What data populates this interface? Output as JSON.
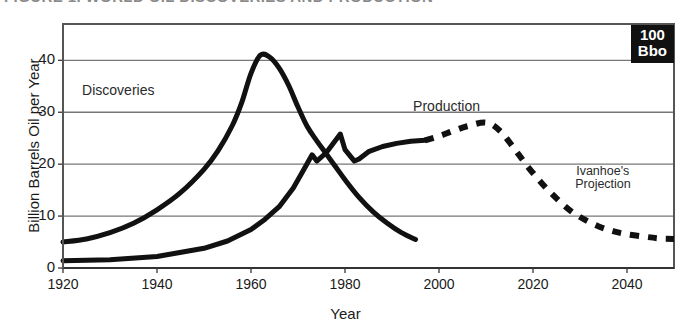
{
  "figure": {
    "caption": "FIGURE 1. WORLD OIL DISCOVERIES AND PRODUCTION",
    "badge_line1": "100",
    "badge_line2": "Bbo",
    "badge_bg": "#111111",
    "badge_fg": "#ffffff",
    "ink_color": "#111111",
    "grid_color": "#777777",
    "frame_color": "#555555"
  },
  "chart_data": {
    "type": "line",
    "title": "",
    "xlabel": "Year",
    "ylabel": "Billion Barrels Oil per Year",
    "xlim": [
      1920,
      2050
    ],
    "ylim": [
      0,
      47
    ],
    "xticks": [
      1920,
      1940,
      1960,
      1980,
      2000,
      2020,
      2040
    ],
    "yticks": [
      0,
      10,
      20,
      30,
      40
    ],
    "xtick_labels": [
      "1920",
      "1940",
      "1960",
      "1980",
      "2000",
      "2020",
      "2040"
    ],
    "ytick_labels": [
      "0",
      "10",
      "20",
      "30",
      "40"
    ],
    "grid": true,
    "grid_axis": "y",
    "legend": "inline-annotations",
    "annotations": [
      {
        "text": "Discoveries",
        "x": 1933,
        "y": 34
      },
      {
        "text": "Production",
        "x": 2003,
        "y": 31
      },
      {
        "text": "Ivanhoe's",
        "x": 2036,
        "y": 18.5
      },
      {
        "text": "Projection",
        "x": 2036,
        "y": 16.0
      }
    ],
    "series": [
      {
        "name": "Discoveries",
        "style": "solid",
        "linewidth": 5,
        "x": [
          1920,
          1925,
          1930,
          1935,
          1940,
          1945,
          1950,
          1953,
          1956,
          1958,
          1960,
          1962,
          1964,
          1966,
          1968,
          1970,
          1972,
          1974,
          1976,
          1978,
          1980,
          1983,
          1986,
          1989,
          1992,
          1995
        ],
        "values": [
          5.0,
          5.6,
          6.8,
          8.6,
          11.2,
          14.5,
          19.0,
          22.6,
          27.4,
          31.8,
          37.5,
          41.0,
          40.6,
          38.5,
          35.2,
          31.0,
          27.2,
          24.5,
          22.0,
          19.5,
          17.0,
          13.6,
          10.8,
          8.6,
          6.8,
          5.5
        ]
      },
      {
        "name": "Production",
        "style": "solid",
        "linewidth": 5,
        "x": [
          1920,
          1930,
          1940,
          1950,
          1955,
          1960,
          1963,
          1966,
          1969,
          1971,
          1973,
          1974,
          1976,
          1979,
          1980,
          1982,
          1983,
          1985,
          1988,
          1991,
          1994,
          1997
        ],
        "values": [
          1.4,
          1.6,
          2.2,
          3.8,
          5.2,
          7.4,
          9.4,
          11.8,
          15.4,
          18.6,
          21.8,
          20.6,
          22.2,
          25.8,
          22.8,
          20.6,
          21.0,
          22.4,
          23.4,
          24.0,
          24.4,
          24.6
        ]
      },
      {
        "name": "Ivanhoe's Projection",
        "style": "dashed",
        "linewidth": 6,
        "x": [
          1997,
          2000,
          2003,
          2006,
          2010,
          2013,
          2016,
          2019,
          2022,
          2025,
          2028,
          2031,
          2034,
          2037,
          2040,
          2044,
          2047,
          2050
        ],
        "values": [
          24.6,
          25.4,
          26.4,
          27.3,
          28.0,
          26.4,
          23.0,
          19.4,
          16.2,
          13.4,
          11.0,
          9.3,
          8.0,
          7.1,
          6.5,
          6.0,
          5.7,
          5.6
        ]
      }
    ]
  }
}
